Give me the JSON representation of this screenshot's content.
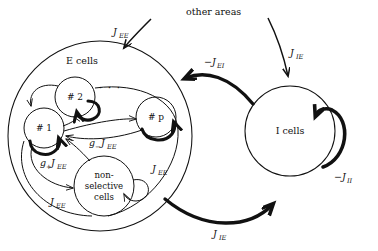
{
  "figure": {
    "title": "other areas",
    "background": "#ffffff",
    "stroke": "#111111"
  },
  "nodes": {
    "e_population": {
      "label": "E cells",
      "name": "e-cells-population"
    },
    "i_population": {
      "label": "I cells",
      "name": "i-cells-population"
    },
    "selective": [
      {
        "label": "# 1"
      },
      {
        "label": "# 2"
      },
      {
        "label": "# p"
      }
    ],
    "nonselective": {
      "line1": "non-",
      "line2": "selective",
      "line3": "cells"
    },
    "ellipsis": "·   ·   ·"
  },
  "connections": {
    "external_to_e": "J",
    "external_to_e_sub": "EE",
    "external_to_i": "J",
    "external_to_i_sub": "IE",
    "i_to_e": "−J",
    "i_to_e_sub": "EI",
    "e_to_i": "J",
    "e_to_i_sub": "IE",
    "i_self": "−J",
    "i_self_sub": "II",
    "pot_self": "g",
    "pot_self_plus": "+",
    "pot_self_J": "J",
    "pot_self_sub": "EE",
    "dep_cross": "g",
    "dep_cross_minus": "−",
    "dep_cross_J": "J",
    "dep_cross_sub": "EE",
    "ns_in": "J",
    "ns_in_sub": "EE",
    "ns_self": "J",
    "ns_self_sub": "EE"
  },
  "labels": {
    "jee_top": "J_EE",
    "jie_top": "J_IE",
    "jei_mid": "-J_EI",
    "jie_bottom": "J_IE",
    "jii_right": "-J_II",
    "gplus_jee": "g+J_EE",
    "gminus_jee": "g-J_EE",
    "jee_ns_in": "J_EE",
    "jee_ns_self": "J_EE"
  }
}
